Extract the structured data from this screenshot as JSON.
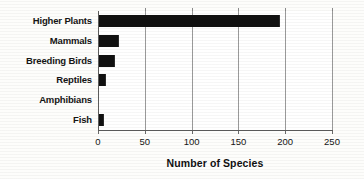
{
  "chart_data": {
    "type": "bar",
    "orientation": "horizontal",
    "title": "",
    "xlabel": "Number of Species",
    "ylabel": "",
    "categories": [
      "Higher Plants",
      "Mammals",
      "Breeding Birds",
      "Reptiles",
      "Amphibians",
      "Fish"
    ],
    "values": [
      193,
      21,
      17,
      7,
      0,
      5
    ],
    "xlim": [
      0,
      250
    ],
    "xticks": [
      0,
      50,
      100,
      150,
      200,
      250
    ],
    "xtick_labels": [
      "0",
      "50",
      "100",
      "150",
      "200",
      "250"
    ],
    "grid": true,
    "grid_axis": "x",
    "legend": false,
    "bar_color": "#111111",
    "background_color": "#fdfdfb",
    "axis_color": "#5c5c5c",
    "gridline_color": "#9a9a9a"
  }
}
